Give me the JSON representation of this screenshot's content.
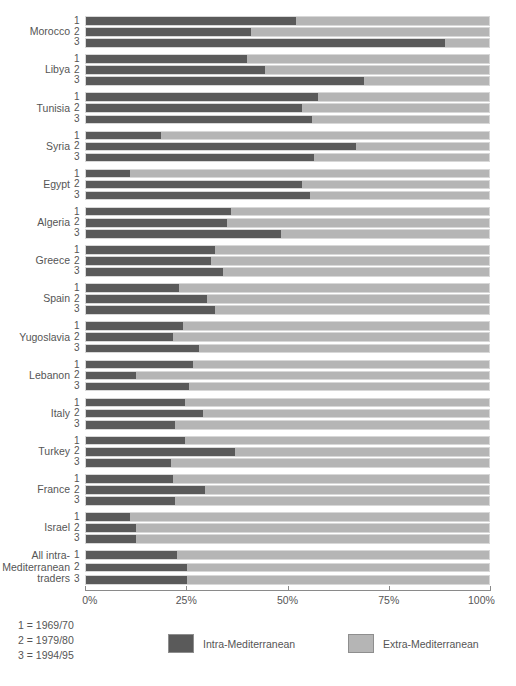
{
  "axis": {
    "ticks": [
      {
        "value": 0,
        "label": "0%"
      },
      {
        "value": 25,
        "label": "25%"
      },
      {
        "value": 50,
        "label": "50%"
      },
      {
        "value": 75,
        "label": "75%"
      },
      {
        "value": 100,
        "label": "100%"
      }
    ]
  },
  "year_key": {
    "line1": "1 = 1969/70",
    "line2": "2 = 1979/80",
    "line3": "3 = 1994/95"
  },
  "legend": {
    "intra_label": "Intra-Mediterranean",
    "extra_label": "Extra-Mediterranean",
    "intra_color": "#5a5a5a",
    "extra_color": "#b5b5b5"
  },
  "series_indices": [
    "1",
    "2",
    "3"
  ],
  "chart_data": {
    "type": "bar",
    "orientation": "horizontal",
    "stacked": true,
    "normalized": true,
    "title": "",
    "xlabel": "",
    "ylabel": "",
    "xlim": [
      0,
      100
    ],
    "grid": false,
    "legend_position": "bottom",
    "categories": [
      "Morocco",
      "Libya",
      "Tunisia",
      "Syria",
      "Egypt",
      "Algeria",
      "Greece",
      "Spain",
      "Yugoslavia",
      "Lebanon",
      "Italy",
      "Turkey",
      "France",
      "Israel",
      "All intra-Mediterranean traders"
    ],
    "periods": [
      "1969/70",
      "1979/80",
      "1994/95"
    ],
    "series": [
      {
        "name": "Intra-Mediterranean",
        "color": "#5a5a5a",
        "values_by_category": {
          "Morocco": [
            52.0,
            41.0,
            89.0
          ],
          "Libya": [
            40.0,
            44.5,
            69.0
          ],
          "Tunisia": [
            57.5,
            53.5,
            56.0
          ],
          "Syria": [
            18.5,
            67.0,
            56.5
          ],
          "Egypt": [
            11.0,
            53.5,
            55.5
          ],
          "Algeria": [
            36.0,
            35.0,
            48.5
          ],
          "Greece": [
            32.0,
            31.0,
            34.0
          ],
          "Spain": [
            23.0,
            30.0,
            32.0
          ],
          "Yugoslavia": [
            24.0,
            21.5,
            28.0
          ],
          "Lebanon": [
            26.5,
            12.5,
            25.5
          ],
          "Italy": [
            24.5,
            29.0,
            22.0
          ],
          "Turkey": [
            24.5,
            37.0,
            21.0
          ],
          "France": [
            21.5,
            29.5,
            22.0
          ],
          "Israel": [
            11.0,
            12.5,
            12.5
          ],
          "All intra-Mediterranean traders": [
            22.5,
            25.0,
            25.0
          ]
        }
      },
      {
        "name": "Extra-Mediterranean",
        "color": "#b5b5b5",
        "values_by_category": {
          "Morocco": [
            48.0,
            59.0,
            11.0
          ],
          "Libya": [
            60.0,
            55.5,
            31.0
          ],
          "Tunisia": [
            42.5,
            46.5,
            44.0
          ],
          "Syria": [
            81.5,
            33.0,
            43.5
          ],
          "Egypt": [
            89.0,
            46.5,
            44.5
          ],
          "Algeria": [
            64.0,
            65.0,
            51.5
          ],
          "Greece": [
            68.0,
            69.0,
            66.0
          ],
          "Spain": [
            77.0,
            70.0,
            68.0
          ],
          "Yugoslavia": [
            76.0,
            78.5,
            72.0
          ],
          "Lebanon": [
            73.5,
            87.5,
            74.5
          ],
          "Italy": [
            75.5,
            71.0,
            78.0
          ],
          "Turkey": [
            75.5,
            63.0,
            79.0
          ],
          "France": [
            78.5,
            70.5,
            78.0
          ],
          "Israel": [
            89.0,
            87.5,
            87.5
          ],
          "All intra-Mediterranean traders": [
            77.5,
            75.0,
            75.0
          ]
        }
      }
    ]
  },
  "category_label_lines": {
    "Morocco": [
      "Morocco"
    ],
    "Libya": [
      "Libya"
    ],
    "Tunisia": [
      "Tunisia"
    ],
    "Syria": [
      "Syria"
    ],
    "Egypt": [
      "Egypt"
    ],
    "Algeria": [
      "Algeria"
    ],
    "Greece": [
      "Greece"
    ],
    "Spain": [
      "Spain"
    ],
    "Yugoslavia": [
      "Yugoslavia"
    ],
    "Lebanon": [
      "Lebanon"
    ],
    "Italy": [
      "Italy"
    ],
    "Turkey": [
      "Turkey"
    ],
    "France": [
      "France"
    ],
    "Israel": [
      "Israel"
    ],
    "All intra-Mediterranean traders": [
      "All intra-",
      "Mediterranean",
      "traders"
    ]
  }
}
